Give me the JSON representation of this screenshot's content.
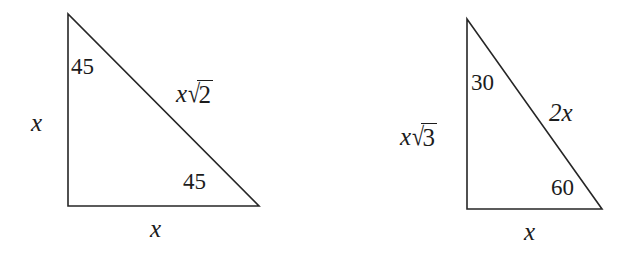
{
  "figure": {
    "background_color": "#ffffff",
    "stroke_color": "#262626",
    "text_color": "#1c1c1c",
    "stroke_width": 1.6,
    "width": 624,
    "height": 253
  },
  "triangles": [
    {
      "id": "triangle-45-45-90",
      "name": "45-45-90 triangle",
      "vertices": {
        "apex": [
          68,
          14
        ],
        "bottom_left": [
          68,
          206
        ],
        "bottom_right": [
          259,
          206
        ]
      },
      "labels": {
        "angle_top": "45",
        "angle_bottom": "45",
        "leg_left": "x",
        "leg_bottom": "x",
        "hypotenuse_coefficient": "x",
        "hypotenuse_radicand": "2"
      }
    },
    {
      "id": "triangle-30-60-90",
      "name": "30-60-90 triangle",
      "vertices": {
        "apex": [
          467,
          19
        ],
        "bottom_left": [
          467,
          209
        ],
        "bottom_right": [
          602,
          209
        ]
      },
      "labels": {
        "angle_top": "30",
        "angle_bottom": "60",
        "leg_left_coefficient": "x",
        "leg_left_radicand": "3",
        "leg_bottom": "x",
        "hypotenuse": "2x"
      }
    }
  ]
}
